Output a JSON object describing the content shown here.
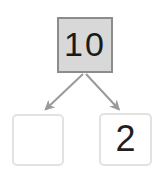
{
  "diagram": {
    "type": "number-bond",
    "whole": {
      "label": "10",
      "fill_color": "#d8d8d8",
      "border_color": "#8c8c8c"
    },
    "parts": [
      {
        "label": "",
        "name": "left-part",
        "fill_color": "#ffffff",
        "border_color": "#e2e2e2"
      },
      {
        "label": "2",
        "name": "right-part",
        "fill_color": "#ffffff",
        "border_color": "#e2e2e2"
      }
    ],
    "arrows": [
      {
        "name": "arrow-to-left-part",
        "color": "#9a9a9a"
      },
      {
        "name": "arrow-to-right-part",
        "color": "#9a9a9a"
      }
    ],
    "background_color": "#ffffff"
  }
}
